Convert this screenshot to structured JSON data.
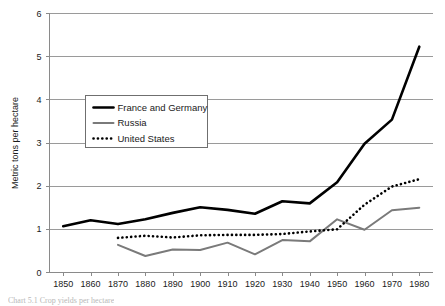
{
  "figure": {
    "caption_partial": "Chart 5.1  Crop yields per hectare",
    "background_color": "#ffffff"
  },
  "chart_data": {
    "type": "line",
    "title": "",
    "xlabel": "",
    "ylabel": "Metric tons per hectare",
    "xlim": [
      1845,
      1985
    ],
    "ylim": [
      0,
      6
    ],
    "yticks": [
      0,
      1,
      2,
      3,
      4,
      5,
      6
    ],
    "xticks": [
      1850,
      1860,
      1870,
      1880,
      1890,
      1900,
      1910,
      1920,
      1930,
      1940,
      1950,
      1960,
      1970,
      1980
    ],
    "xtick_labels": [
      "1850",
      "1860",
      "1870",
      "1880",
      "1890",
      "1900",
      "1910",
      "1920",
      "1930",
      "1940",
      "1950",
      "1960",
      "1970",
      "1980"
    ],
    "ytick_labels": [
      "0",
      "1",
      "2",
      "3",
      "4",
      "5",
      "6"
    ],
    "grid": "horizontal",
    "legend_position": "upper-left-inside",
    "series": [
      {
        "name": "France and Germany",
        "color": "#000000",
        "style": "solid",
        "width": 2.6,
        "x": [
          1850,
          1860,
          1870,
          1880,
          1890,
          1900,
          1910,
          1920,
          1930,
          1940,
          1950,
          1960,
          1970,
          1980
        ],
        "values": [
          1.06,
          1.2,
          1.11,
          1.22,
          1.37,
          1.5,
          1.44,
          1.35,
          1.64,
          1.59,
          2.08,
          2.97,
          3.53,
          5.22
        ]
      },
      {
        "name": "Russia",
        "color": "#7a7a7a",
        "style": "solid",
        "width": 2.0,
        "x": [
          1870,
          1880,
          1890,
          1900,
          1910,
          1920,
          1930,
          1940,
          1950,
          1960,
          1970,
          1980
        ],
        "values": [
          0.63,
          0.37,
          0.52,
          0.51,
          0.68,
          0.41,
          0.74,
          0.71,
          1.22,
          0.98,
          1.43,
          1.49
        ]
      },
      {
        "name": "United States",
        "color": "#000000",
        "style": "dotted",
        "width": 2.6,
        "x": [
          1870,
          1880,
          1890,
          1900,
          1910,
          1920,
          1930,
          1940,
          1950,
          1960,
          1970,
          1980
        ],
        "values": [
          0.79,
          0.84,
          0.8,
          0.85,
          0.86,
          0.86,
          0.88,
          0.94,
          0.99,
          1.56,
          1.98,
          2.15
        ]
      }
    ]
  }
}
